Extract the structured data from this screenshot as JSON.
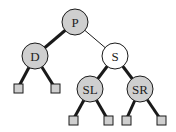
{
  "diagram": {
    "type": "binary-tree",
    "colors": {
      "node_fill_gray": "#cfcfcf",
      "node_fill_white": "#ffffff",
      "stroke": "#1a1a1a",
      "leaf_fill": "#cfcfcf"
    },
    "nodes": [
      {
        "id": "P",
        "label": "P",
        "cx": 75,
        "cy": 22,
        "fill": "gray"
      },
      {
        "id": "D",
        "label": "D",
        "cx": 35,
        "cy": 56,
        "fill": "gray"
      },
      {
        "id": "S",
        "label": "S",
        "cx": 115,
        "cy": 56,
        "fill": "white"
      },
      {
        "id": "SL",
        "label": "SL",
        "cx": 90,
        "cy": 89,
        "fill": "gray"
      },
      {
        "id": "SR",
        "label": "SR",
        "cx": 140,
        "cy": 89,
        "fill": "gray"
      }
    ],
    "leaves": [
      {
        "id": "leaf-1",
        "x": 14,
        "y": 84
      },
      {
        "id": "leaf-2",
        "x": 51,
        "y": 84
      },
      {
        "id": "leaf-3",
        "x": 69,
        "y": 116
      },
      {
        "id": "leaf-4",
        "x": 104,
        "y": 116
      },
      {
        "id": "leaf-5",
        "x": 122,
        "y": 116
      },
      {
        "id": "leaf-6",
        "x": 157,
        "y": 116
      }
    ],
    "edges": [
      {
        "from": "P",
        "to": "D",
        "weight": "thick"
      },
      {
        "from": "P",
        "to": "S",
        "weight": "thin"
      },
      {
        "from": "D",
        "to": "leaf-1",
        "weight": "thick"
      },
      {
        "from": "D",
        "to": "leaf-2",
        "weight": "thick"
      },
      {
        "from": "S",
        "to": "SL",
        "weight": "thick"
      },
      {
        "from": "S",
        "to": "SR",
        "weight": "thick"
      },
      {
        "from": "SL",
        "to": "leaf-3",
        "weight": "thick"
      },
      {
        "from": "SL",
        "to": "leaf-4",
        "weight": "thick"
      },
      {
        "from": "SR",
        "to": "leaf-5",
        "weight": "thick"
      },
      {
        "from": "SR",
        "to": "leaf-6",
        "weight": "thick"
      }
    ]
  }
}
